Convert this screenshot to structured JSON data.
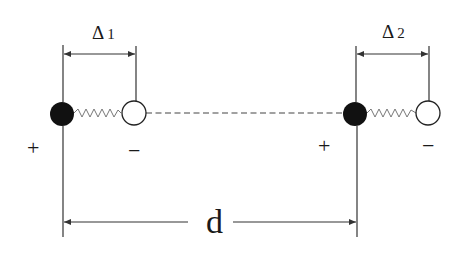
{
  "diagram": {
    "colors": {
      "line": "#333333",
      "filled_charge": "#111111",
      "open_charge_fill": "#ffffff"
    },
    "dipoles": [
      {
        "id": "dipole-1",
        "separation_label": {
          "symbol": "Δ",
          "index": "1"
        },
        "positive_sign": "+",
        "negative_sign": "−"
      },
      {
        "id": "dipole-2",
        "separation_label": {
          "symbol": "Δ",
          "index": "2"
        },
        "positive_sign": "+",
        "negative_sign": "−"
      }
    ],
    "distance_label": "d"
  }
}
